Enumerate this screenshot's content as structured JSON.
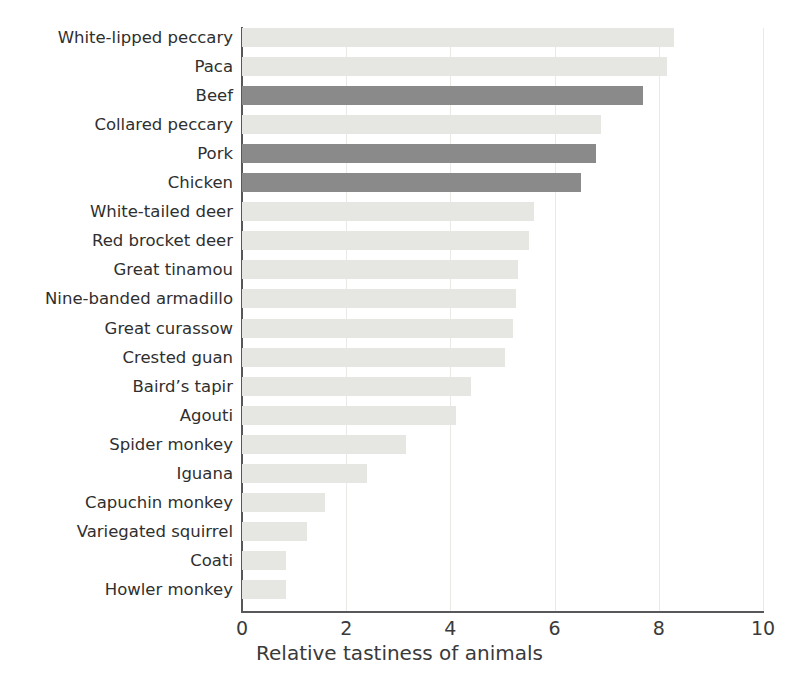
{
  "chart_data": {
    "type": "bar",
    "orientation": "horizontal",
    "title": "",
    "xlabel": "Relative tastiness of animals",
    "ylabel": "",
    "xlim": [
      0,
      10
    ],
    "xticks": [
      "0",
      "2",
      "4",
      "6",
      "8",
      "10"
    ],
    "grid": "vertical-major",
    "legend": "none",
    "categories": [
      "White-lipped peccary",
      "Paca",
      "Beef",
      "Collared peccary",
      "Pork",
      "Chicken",
      "White-tailed deer",
      "Red brocket deer",
      "Great tinamou",
      "Nine-banded armadillo",
      "Great curassow",
      "Crested guan",
      "Baird’s tapir",
      "Agouti",
      "Spider monkey",
      "Iguana",
      "Capuchin monkey",
      "Variegated squirrel",
      "Coati",
      "Howler monkey"
    ],
    "values": [
      8.3,
      8.15,
      7.7,
      6.9,
      6.8,
      6.5,
      5.6,
      5.5,
      5.3,
      5.25,
      5.2,
      5.05,
      4.4,
      4.1,
      3.15,
      2.4,
      1.6,
      1.25,
      0.85,
      0.85
    ],
    "bar_styles": [
      "light",
      "light",
      "dark",
      "light",
      "dark",
      "dark",
      "light",
      "light",
      "light",
      "light",
      "light",
      "light",
      "light",
      "light",
      "light",
      "light",
      "light",
      "light",
      "light",
      "light"
    ],
    "colors": {
      "light_bar": "#e6e7e3",
      "dark_bar": "#8a8a8a",
      "axis": "#58585a",
      "gridline": "#e9e9e6",
      "text": "#2f2f2f"
    }
  },
  "caption": ""
}
